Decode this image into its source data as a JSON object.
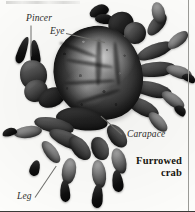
{
  "figure": {
    "caption_line1": "Furrowed",
    "caption_line2": "crab",
    "background_color": "#fdfdfb",
    "rule_color": "#3a3a38"
  },
  "labels": {
    "pincer": "Pincer",
    "eye": "Eye",
    "carapace": "Carapace",
    "leg": "Leg"
  },
  "anatomy": {
    "shell_color": "#332f2c",
    "limb_color": "#575550",
    "highlight_color": "#e8e6de"
  }
}
